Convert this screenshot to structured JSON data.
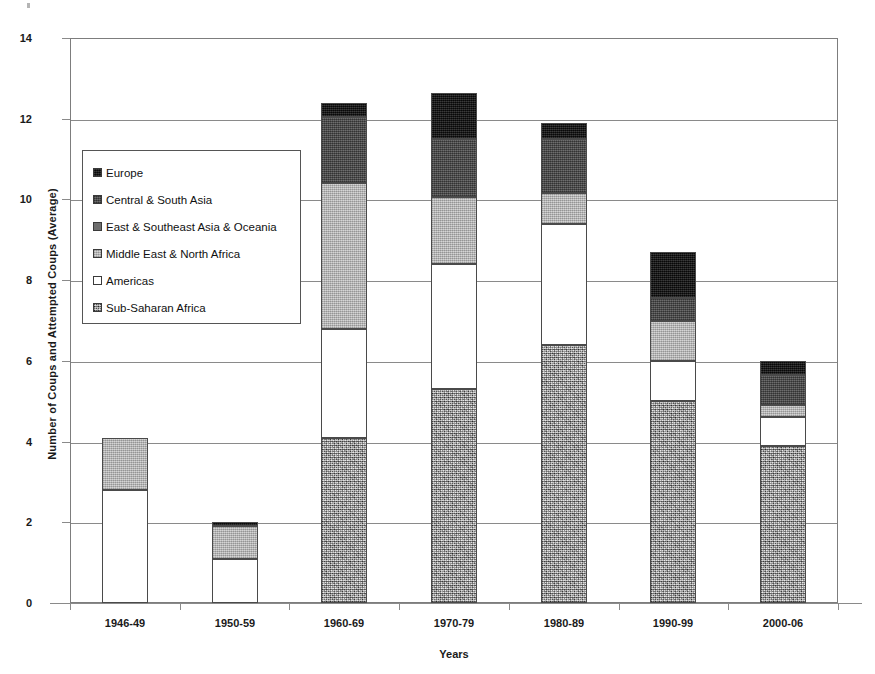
{
  "chart_data": {
    "type": "bar",
    "subtype": "stacked-column",
    "title": "",
    "xlabel": "Years",
    "ylabel": "Number of Coups and Attempted Coups (Average)",
    "ylim": [
      0,
      14
    ],
    "yticks": [
      0,
      2,
      4,
      6,
      8,
      10,
      12,
      14
    ],
    "ytick_labels": [
      "0",
      "2",
      "4",
      "6",
      "8",
      "10",
      "12",
      "14"
    ],
    "grid": true,
    "legend_position": "inside-upper-left",
    "categories": [
      "1946-49",
      "1950-59",
      "1960-69",
      "1970-79",
      "1980-89",
      "1990-99",
      "2000-06"
    ],
    "stack_order_bottom_to_top": [
      "Sub-Saharan Africa",
      "Americas",
      "Middle East & North Africa",
      "East & Southeast Asia & Oceania",
      "Central & South Asia",
      "Europe"
    ],
    "series": [
      {
        "name": "Sub-Saharan Africa",
        "color": "#b3b3b3",
        "pattern": "speckled",
        "values": [
          0.0,
          0.0,
          4.1,
          5.3,
          6.4,
          5.0,
          3.9
        ]
      },
      {
        "name": "Americas",
        "color": "#ffffff",
        "pattern": "solid",
        "values": [
          2.8,
          1.1,
          2.7,
          3.1,
          3.0,
          1.0,
          0.7
        ]
      },
      {
        "name": "Middle East & North Africa",
        "color": "#b8b8b8",
        "pattern": "solid",
        "values": [
          1.3,
          0.8,
          3.6,
          1.65,
          0.75,
          1.0,
          0.3
        ]
      },
      {
        "name": "East & Southeast Asia & Oceania",
        "color": "#6e6e6e",
        "pattern": "solid",
        "values": [
          0.0,
          0.0,
          0.0,
          0.0,
          0.0,
          0.0,
          0.0
        ]
      },
      {
        "name": "Central & South Asia",
        "color": "#4f4f4f",
        "pattern": "solid",
        "values": [
          0.0,
          0.0,
          1.65,
          1.45,
          1.35,
          0.55,
          0.75
        ]
      },
      {
        "name": "Europe",
        "color": "#111111",
        "pattern": "solid",
        "values": [
          0.0,
          0.1,
          0.35,
          1.15,
          0.4,
          1.15,
          0.35
        ]
      }
    ],
    "totals": [
      4.1,
      2.0,
      12.4,
      12.65,
      11.9,
      8.7,
      6.0
    ]
  },
  "axes": {
    "y_title": "Number of Coups and Attempted Coups (Average)",
    "x_title": "Years",
    "y_tick_0": "0",
    "y_tick_1": "2",
    "y_tick_2": "4",
    "y_tick_3": "6",
    "y_tick_4": "8",
    "y_tick_5": "10",
    "y_tick_6": "12",
    "y_tick_7": "14"
  },
  "legend": {
    "items": [
      {
        "label": "Europe",
        "swatch": "#111111"
      },
      {
        "label": "Central & South Asia",
        "swatch": "#4f4f4f"
      },
      {
        "label": "East & Southeast Asia & Oceania",
        "swatch": "#6e6e6e"
      },
      {
        "label": "Middle East & North Africa",
        "swatch": "#b8b8b8"
      },
      {
        "label": "Americas",
        "swatch": "#ffffff"
      },
      {
        "label": "Sub-Saharan Africa",
        "swatch": "#b3b3b3"
      }
    ]
  },
  "x_labels": {
    "c0": "1946-49",
    "c1": "1950-59",
    "c2": "1960-69",
    "c3": "1970-79",
    "c4": "1980-89",
    "c5": "1990-99",
    "c6": "2000-06"
  }
}
